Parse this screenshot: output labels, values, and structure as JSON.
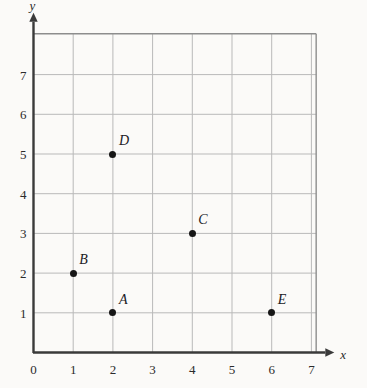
{
  "chart_data": {
    "type": "scatter",
    "title": "",
    "xlabel": "x",
    "ylabel": "y",
    "xlim": [
      0,
      7.9
    ],
    "ylim": [
      0,
      8.0
    ],
    "grid": true,
    "legend": "none",
    "xticks": [
      "0",
      "1",
      "2",
      "3",
      "4",
      "5",
      "6",
      "7"
    ],
    "yticks": [
      "0",
      "1",
      "2",
      "3",
      "4",
      "5",
      "6",
      "7"
    ],
    "xtick_values": [
      0,
      1,
      2,
      3,
      4,
      5,
      6,
      7
    ],
    "ytick_values": [
      0,
      1,
      2,
      3,
      4,
      5,
      6,
      7
    ],
    "points": [
      {
        "label": "A",
        "x": 2,
        "y": 1
      },
      {
        "label": "B",
        "x": 1,
        "y": 2
      },
      {
        "label": "C",
        "x": 4,
        "y": 3
      },
      {
        "label": "D",
        "x": 2,
        "y": 5
      },
      {
        "label": "E",
        "x": 6,
        "y": 1
      }
    ],
    "marker": "filled-circle",
    "marker_color": "#161616",
    "grid_color": "#b9b9b9",
    "axis_color": "#3a3a3a",
    "background_color": "#fbfaf8"
  }
}
